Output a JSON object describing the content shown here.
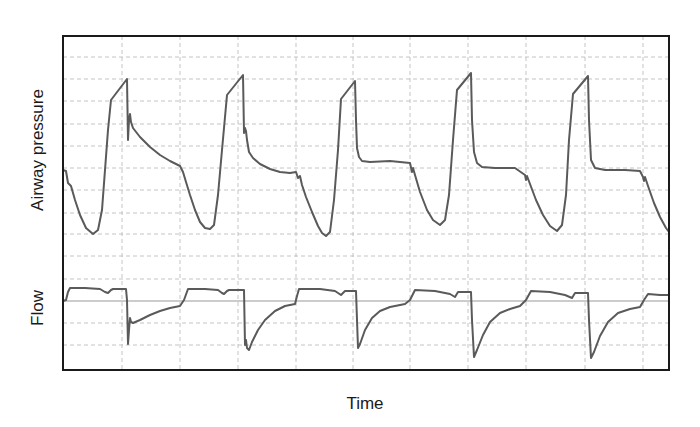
{
  "chart_data": {
    "type": "line",
    "title": "",
    "xlabel": "Time",
    "grid": true,
    "legend": null,
    "plot_area": {
      "x": 63,
      "y": 36,
      "width": 606,
      "height": 334
    },
    "grid_x": [
      122,
      180,
      238,
      296,
      353,
      410,
      468,
      526,
      585,
      643
    ],
    "grid_y": [
      57,
      79,
      101,
      124,
      146,
      168,
      190,
      213,
      234,
      256,
      279,
      323,
      345
    ],
    "panels": [
      {
        "name": "Airway pressure",
        "ylabel": "Airway pressure",
        "units": "arbitrary",
        "description": "Five ventilator breath cycles: rapid inspiratory rise to a peak, sharp drop, then plateau/decay followed by a negative-going dip (patient effort) to a trough before the next breath.",
        "series": [
          {
            "name": "Airway pressure",
            "points": [
              [
                63,
                170
              ],
              [
                66,
                171
              ],
              [
                68,
                183
              ],
              [
                71,
                186
              ],
              [
                75,
                200
              ],
              [
                80,
                215
              ],
              [
                86,
                228
              ],
              [
                93,
                234
              ],
              [
                98,
                230
              ],
              [
                102,
                210
              ],
              [
                105,
                170
              ],
              [
                108,
                130
              ],
              [
                111,
                100
              ],
              [
                127,
                79
              ],
              [
                128,
                140
              ],
              [
                129,
                120
              ],
              [
                130,
                114
              ],
              [
                131,
                122
              ],
              [
                133,
                128
              ],
              [
                140,
                137
              ],
              [
                150,
                147
              ],
              [
                160,
                155
              ],
              [
                170,
                161
              ],
              [
                180,
                166
              ],
              [
                183,
                172
              ],
              [
                186,
                182
              ],
              [
                190,
                195
              ],
              [
                195,
                210
              ],
              [
                200,
                222
              ],
              [
                205,
                228
              ],
              [
                210,
                229
              ],
              [
                214,
                225
              ],
              [
                218,
                195
              ],
              [
                222,
                150
              ],
              [
                227,
                95
              ],
              [
                243,
                75
              ],
              [
                244,
                133
              ],
              [
                245,
                128
              ],
              [
                246,
                131
              ],
              [
                247,
                140
              ],
              [
                249,
                152
              ],
              [
                253,
                158
              ],
              [
                260,
                164
              ],
              [
                270,
                169
              ],
              [
                280,
                172
              ],
              [
                290,
                173
              ],
              [
                296,
                172
              ],
              [
                298,
                178
              ],
              [
                300,
                176
              ],
              [
                302,
                185
              ],
              [
                306,
                197
              ],
              [
                312,
                212
              ],
              [
                318,
                226
              ],
              [
                322,
                233
              ],
              [
                326,
                236
              ],
              [
                330,
                232
              ],
              [
                334,
                200
              ],
              [
                338,
                150
              ],
              [
                341,
                99
              ],
              [
                355,
                81
              ],
              [
                356,
                120
              ],
              [
                357,
                148
              ],
              [
                359,
                157
              ],
              [
                362,
                161
              ],
              [
                370,
                162
              ],
              [
                390,
                161
              ],
              [
                410,
                163
              ],
              [
                412,
                172
              ],
              [
                413,
                168
              ],
              [
                415,
                175
              ],
              [
                420,
                192
              ],
              [
                427,
                210
              ],
              [
                433,
                220
              ],
              [
                440,
                225
              ],
              [
                445,
                220
              ],
              [
                449,
                195
              ],
              [
                453,
                140
              ],
              [
                457,
                90
              ],
              [
                471,
                73
              ],
              [
                472,
                120
              ],
              [
                474,
                152
              ],
              [
                477,
                163
              ],
              [
                482,
                167
              ],
              [
                495,
                168
              ],
              [
                515,
                168
              ],
              [
                525,
                175
              ],
              [
                526,
                180
              ],
              [
                527,
                176
              ],
              [
                530,
                184
              ],
              [
                536,
                200
              ],
              [
                543,
                215
              ],
              [
                550,
                226
              ],
              [
                557,
                231
              ],
              [
                562,
                225
              ],
              [
                566,
                195
              ],
              [
                569,
                140
              ],
              [
                573,
                94
              ],
              [
                588,
                76
              ],
              [
                589,
                120
              ],
              [
                591,
                160
              ],
              [
                595,
                168
              ],
              [
                605,
                170
              ],
              [
                625,
                170
              ],
              [
                640,
                171
              ],
              [
                643,
                177
              ],
              [
                644,
                181
              ],
              [
                645,
                177
              ],
              [
                648,
                186
              ],
              [
                654,
                203
              ],
              [
                660,
                217
              ],
              [
                666,
                228
              ],
              [
                669,
                232
              ]
            ]
          }
        ],
        "peaks": [
          {
            "x": 127,
            "y": 79
          },
          {
            "x": 243,
            "y": 75
          },
          {
            "x": 355,
            "y": 81
          },
          {
            "x": 471,
            "y": 73
          },
          {
            "x": 588,
            "y": 76
          }
        ],
        "troughs": [
          {
            "x": 93,
            "y": 234
          },
          {
            "x": 210,
            "y": 229
          },
          {
            "x": 326,
            "y": 236
          },
          {
            "x": 440,
            "y": 225
          },
          {
            "x": 557,
            "y": 231
          }
        ]
      },
      {
        "name": "Flow",
        "ylabel": "Flow",
        "units": "arbitrary",
        "baseline_y": 301,
        "description": "Square-wave inspiratory flow above zero line with a small dip late in inspiration, followed by a sharp negative expiratory spike that decays exponentially back toward zero.",
        "series": [
          {
            "name": "Flow",
            "points": [
              [
                63,
                301
              ],
              [
                66,
                300
              ],
              [
                68,
                292
              ],
              [
                70,
                288
              ],
              [
                85,
                288
              ],
              [
                100,
                289
              ],
              [
                105,
                292
              ],
              [
                108,
                293
              ],
              [
                111,
                290
              ],
              [
                113,
                289
              ],
              [
                126,
                289
              ],
              [
                127,
                300
              ],
              [
                128,
                344
              ],
              [
                129,
                330
              ],
              [
                130,
                318
              ],
              [
                131,
                322
              ],
              [
                133,
                323
              ],
              [
                140,
                320
              ],
              [
                150,
                315
              ],
              [
                160,
                311
              ],
              [
                170,
                308
              ],
              [
                180,
                306
              ],
              [
                184,
                300
              ],
              [
                188,
                289
              ],
              [
                205,
                289
              ],
              [
                218,
                290
              ],
              [
                222,
                293
              ],
              [
                224,
                294
              ],
              [
                227,
                291
              ],
              [
                229,
                290
              ],
              [
                244,
                290
              ],
              [
                245,
                345
              ],
              [
                246,
                340
              ],
              [
                247,
                348
              ],
              [
                249,
                350
              ],
              [
                252,
                342
              ],
              [
                258,
                330
              ],
              [
                265,
                320
              ],
              [
                275,
                311
              ],
              [
                285,
                306
              ],
              [
                295,
                304
              ],
              [
                297,
                296
              ],
              [
                299,
                289
              ],
              [
                320,
                289
              ],
              [
                335,
                291
              ],
              [
                341,
                295
              ],
              [
                345,
                291
              ],
              [
                356,
                291
              ],
              [
                357,
                320
              ],
              [
                358,
                348
              ],
              [
                360,
                344
              ],
              [
                365,
                330
              ],
              [
                372,
                318
              ],
              [
                380,
                311
              ],
              [
                390,
                307
              ],
              [
                400,
                305
              ],
              [
                405,
                304
              ],
              [
                410,
                300
              ],
              [
                415,
                290
              ],
              [
                435,
                291
              ],
              [
                450,
                294
              ],
              [
                455,
                297
              ],
              [
                458,
                292
              ],
              [
                471,
                292
              ],
              [
                472,
                320
              ],
              [
                474,
                357
              ],
              [
                477,
                350
              ],
              [
                483,
                335
              ],
              [
                490,
                322
              ],
              [
                500,
                313
              ],
              [
                510,
                309
              ],
              [
                520,
                306
              ],
              [
                526,
                300
              ],
              [
                531,
                291
              ],
              [
                550,
                292
              ],
              [
                565,
                295
              ],
              [
                572,
                298
              ],
              [
                575,
                293
              ],
              [
                588,
                293
              ],
              [
                589,
                320
              ],
              [
                591,
                358
              ],
              [
                594,
                352
              ],
              [
                600,
                336
              ],
              [
                608,
                322
              ],
              [
                618,
                313
              ],
              [
                630,
                309
              ],
              [
                640,
                307
              ],
              [
                644,
                300
              ],
              [
                648,
                294
              ],
              [
                660,
                295
              ],
              [
                669,
                295
              ]
            ]
          }
        ],
        "expiratory_minima": [
          {
            "x": 128,
            "y": 344
          },
          {
            "x": 249,
            "y": 350
          },
          {
            "x": 358,
            "y": 348
          },
          {
            "x": 474,
            "y": 357
          },
          {
            "x": 591,
            "y": 358
          }
        ]
      }
    ]
  },
  "labels": {
    "y_top": "Airway pressure",
    "y_bottom": "Flow",
    "x": "Time"
  },
  "colors": {
    "trace": "#5a5a5a",
    "grid": "#bdbdbd",
    "frame": "#1a1a1a",
    "baseline": "#9a9a9a",
    "background": "#ffffff"
  }
}
